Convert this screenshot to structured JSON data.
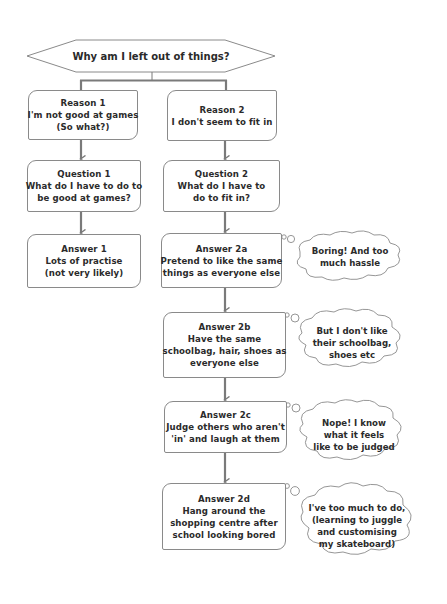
{
  "diagram": {
    "title": "Why am I left out of things?",
    "colors": {
      "connector": "#7a7a7a",
      "box_border": "#8a8a8a",
      "text": "#2b2b2b",
      "background": "#ffffff"
    },
    "left_column": {
      "reason": {
        "lines": [
          "Reason 1",
          "I'm not good at games",
          "(So what?)"
        ]
      },
      "question": {
        "lines": [
          "Question 1",
          "What do I have to do to",
          "be good at games?"
        ]
      },
      "answer": {
        "lines": [
          "Answer 1",
          "Lots of practise",
          "(not very likely)"
        ]
      }
    },
    "right_column": {
      "reason": {
        "lines": [
          "Reason 2",
          "I don't seem to fit in"
        ]
      },
      "question": {
        "lines": [
          "Question 2",
          "What do I have to",
          "do to fit in?"
        ]
      },
      "answers": [
        {
          "lines": [
            "Answer 2a",
            "Pretend to like the same",
            "things as everyone else"
          ],
          "thought": [
            "Boring! And too",
            "much hassle"
          ]
        },
        {
          "lines": [
            "Answer 2b",
            "Have the same",
            "schoolbag, hair, shoes as",
            "everyone else"
          ],
          "thought": [
            "But I don't like",
            "their schoolbag,",
            "shoes etc"
          ]
        },
        {
          "lines": [
            "Answer 2c",
            "Judge others who aren't",
            "'in' and laugh at them"
          ],
          "thought": [
            "Nope! I know",
            "what it feels",
            "like to be judged"
          ]
        },
        {
          "lines": [
            "Answer 2d",
            "Hang around the",
            "shopping centre after",
            "school looking bored"
          ],
          "thought": [
            "I've too much to do,",
            "(learning to juggle",
            "and customising",
            "my skateboard)"
          ]
        }
      ]
    }
  }
}
